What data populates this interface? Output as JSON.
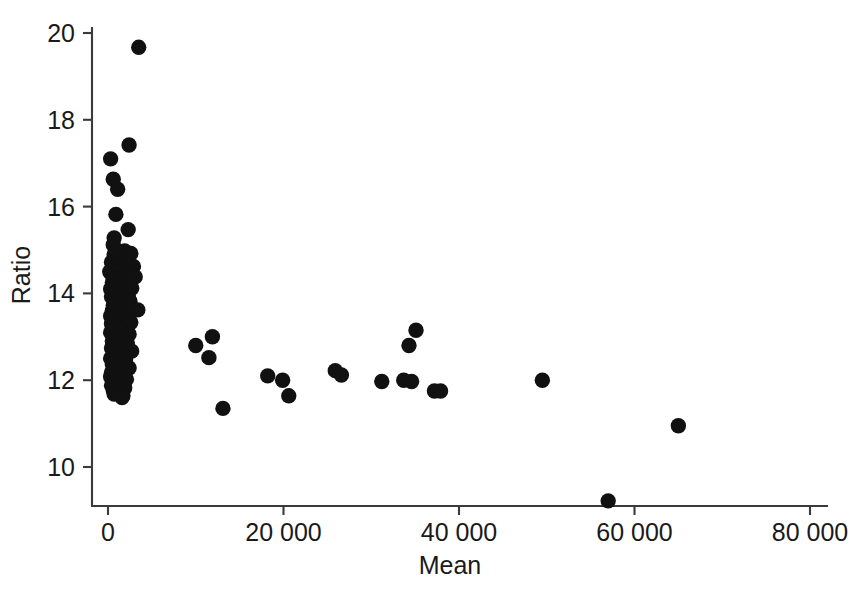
{
  "chart_data": {
    "type": "scatter",
    "title": "",
    "xlabel": "Mean",
    "ylabel": "Ratio",
    "xlim": [
      0,
      82000
    ],
    "ylim": [
      8.6,
      20.4
    ],
    "grid": false,
    "legend": null,
    "marker": {
      "shape": "circle",
      "color": "#111111",
      "size": 9
    },
    "xticks": [
      0,
      20000,
      40000,
      60000,
      80000
    ],
    "xtick_labels": [
      "0",
      "20 000",
      "40 000",
      "60 000",
      "80 000"
    ],
    "yticks": [
      10,
      12,
      14,
      16,
      18,
      20
    ],
    "ytick_labels": [
      "10",
      "12",
      "14",
      "16",
      "18",
      "20"
    ],
    "n_points": 128,
    "points": [
      [
        3500,
        19.67
      ],
      [
        2400,
        17.42
      ],
      [
        300,
        17.1
      ],
      [
        600,
        16.63
      ],
      [
        1100,
        16.4
      ],
      [
        900,
        15.82
      ],
      [
        2300,
        15.47
      ],
      [
        700,
        15.28
      ],
      [
        600,
        15.12
      ],
      [
        1900,
        14.98
      ],
      [
        2600,
        14.92
      ],
      [
        700,
        14.9
      ],
      [
        1200,
        14.83
      ],
      [
        400,
        14.72
      ],
      [
        1500,
        14.7
      ],
      [
        2900,
        14.62
      ],
      [
        900,
        14.58
      ],
      [
        1400,
        14.55
      ],
      [
        200,
        14.5
      ],
      [
        1000,
        14.48
      ],
      [
        2000,
        14.45
      ],
      [
        2600,
        14.42
      ],
      [
        3100,
        14.38
      ],
      [
        600,
        14.35
      ],
      [
        1300,
        14.32
      ],
      [
        1800,
        14.3
      ],
      [
        500,
        14.25
      ],
      [
        2200,
        14.22
      ],
      [
        900,
        14.18
      ],
      [
        1500,
        14.15
      ],
      [
        2700,
        14.12
      ],
      [
        300,
        14.1
      ],
      [
        1100,
        14.08
      ],
      [
        1900,
        14.05
      ],
      [
        700,
        14.0
      ],
      [
        1400,
        13.98
      ],
      [
        2300,
        13.95
      ],
      [
        400,
        13.92
      ],
      [
        1000,
        13.88
      ],
      [
        1700,
        13.85
      ],
      [
        2500,
        13.82
      ],
      [
        800,
        13.8
      ],
      [
        1300,
        13.76
      ],
      [
        600,
        13.72
      ],
      [
        2000,
        13.7
      ],
      [
        1100,
        13.66
      ],
      [
        3400,
        13.62
      ],
      [
        500,
        13.6
      ],
      [
        1600,
        13.57
      ],
      [
        900,
        13.54
      ],
      [
        2200,
        13.5
      ],
      [
        300,
        13.48
      ],
      [
        1300,
        13.45
      ],
      [
        1900,
        13.42
      ],
      [
        700,
        13.4
      ],
      [
        1000,
        13.36
      ],
      [
        2600,
        13.33
      ],
      [
        400,
        13.3
      ],
      [
        1500,
        13.28
      ],
      [
        800,
        13.25
      ],
      [
        2100,
        13.22
      ],
      [
        1200,
        13.18
      ],
      [
        600,
        13.15
      ],
      [
        1700,
        13.12
      ],
      [
        300,
        13.1
      ],
      [
        2400,
        13.06
      ],
      [
        1000,
        13.03
      ],
      [
        1400,
        13.0
      ],
      [
        700,
        12.97
      ],
      [
        1900,
        12.94
      ],
      [
        500,
        12.9
      ],
      [
        1100,
        12.87
      ],
      [
        2200,
        12.84
      ],
      [
        800,
        12.8
      ],
      [
        1500,
        12.77
      ],
      [
        400,
        12.74
      ],
      [
        1300,
        12.7
      ],
      [
        2700,
        12.67
      ],
      [
        900,
        12.64
      ],
      [
        600,
        12.6
      ],
      [
        1700,
        12.57
      ],
      [
        1100,
        12.54
      ],
      [
        300,
        12.5
      ],
      [
        2000,
        12.47
      ],
      [
        800,
        12.44
      ],
      [
        1400,
        12.4
      ],
      [
        500,
        12.37
      ],
      [
        1000,
        12.33
      ],
      [
        1800,
        12.3
      ],
      [
        2400,
        12.28
      ],
      [
        700,
        12.25
      ],
      [
        1200,
        12.22
      ],
      [
        400,
        12.18
      ],
      [
        1600,
        12.15
      ],
      [
        900,
        12.12
      ],
      [
        300,
        12.08
      ],
      [
        1300,
        12.05
      ],
      [
        2100,
        12.02
      ],
      [
        600,
        11.98
      ],
      [
        1000,
        11.95
      ],
      [
        1500,
        11.92
      ],
      [
        400,
        11.88
      ],
      [
        800,
        11.85
      ],
      [
        1900,
        11.82
      ],
      [
        1200,
        11.8
      ],
      [
        600,
        11.76
      ],
      [
        1400,
        11.72
      ],
      [
        700,
        11.68
      ],
      [
        1700,
        11.64
      ],
      [
        1600,
        11.6
      ],
      [
        10000,
        12.8
      ],
      [
        11900,
        13.0
      ],
      [
        11500,
        12.52
      ],
      [
        13100,
        11.35
      ],
      [
        18200,
        12.1
      ],
      [
        19900,
        12.0
      ],
      [
        20600,
        11.64
      ],
      [
        25900,
        12.22
      ],
      [
        26600,
        12.12
      ],
      [
        31200,
        11.97
      ],
      [
        33700,
        12.0
      ],
      [
        34600,
        11.97
      ],
      [
        34300,
        12.8
      ],
      [
        35100,
        13.15
      ],
      [
        37200,
        11.75
      ],
      [
        37900,
        11.75
      ],
      [
        49500,
        12.0
      ],
      [
        57000,
        9.22
      ],
      [
        65000,
        10.95
      ]
    ]
  }
}
